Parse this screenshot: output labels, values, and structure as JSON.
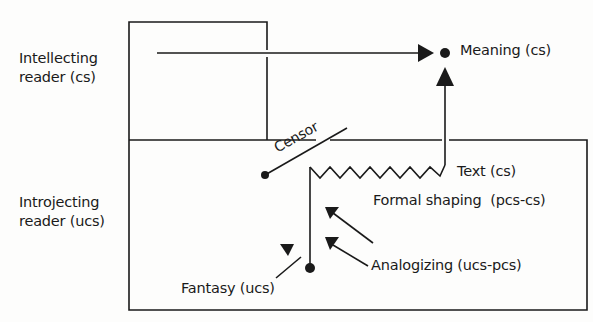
{
  "diagram": {
    "regions": [
      {
        "id": "conscious",
        "label_lines": [
          "Intellecting",
          "reader (cs)"
        ]
      },
      {
        "id": "unconscious",
        "label_lines": [
          "Introjecting",
          "reader (ucs)"
        ]
      }
    ],
    "nodes": {
      "meaning": "Meaning (cs)",
      "text": "Text (cs)",
      "formal_shaping": "Formal shaping  (pcs-cs)",
      "analogizing": "Analogizing (ucs-pcs)",
      "fantasy": "Fantasy (ucs)",
      "censor": "Censor"
    },
    "colors": {
      "ink": "#1a1a1a",
      "background": "#fdfdfc"
    }
  }
}
